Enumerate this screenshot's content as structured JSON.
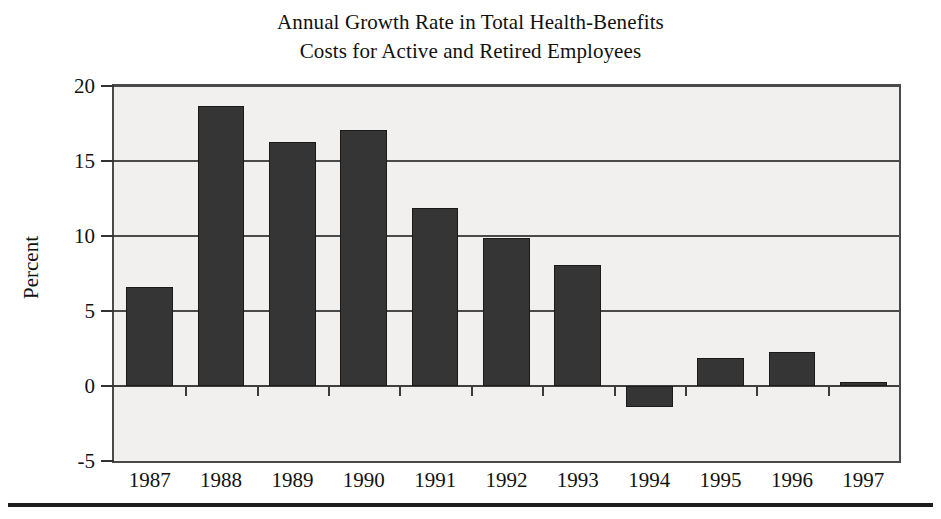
{
  "chart_data": {
    "type": "bar",
    "title": "Annual Growth Rate in Total Health-Benefits Costs for Active and Retired Employees",
    "title_lines": [
      "Annual Growth Rate in Total Health-Benefits",
      "Costs for Active and Retired Employees"
    ],
    "xlabel": "",
    "ylabel": "Percent",
    "categories": [
      "1987",
      "1988",
      "1989",
      "1990",
      "1991",
      "1992",
      "1993",
      "1994",
      "1995",
      "1996",
      "1997"
    ],
    "values": [
      6.6,
      18.7,
      16.3,
      17.1,
      11.9,
      9.9,
      8.1,
      -1.4,
      1.9,
      2.3,
      0.3
    ],
    "series": [
      {
        "name": "Annual growth rate",
        "values": [
          6.6,
          18.7,
          16.3,
          17.1,
          11.9,
          9.9,
          8.1,
          -1.4,
          1.9,
          2.3,
          0.3
        ]
      }
    ],
    "ylim": [
      -5,
      20
    ],
    "yticks": [
      20,
      15,
      10,
      5,
      0,
      -5
    ],
    "ytick_labels": [
      "20",
      "15",
      "10",
      "5",
      "0",
      "-5"
    ],
    "grid": true,
    "grid_axis": "y",
    "legend": false,
    "legend_position": "none",
    "bar_color": "#353535",
    "plot_background": "#f1f0ee",
    "axis_color": "#4a4a4a",
    "page_background": "#ffffff"
  }
}
